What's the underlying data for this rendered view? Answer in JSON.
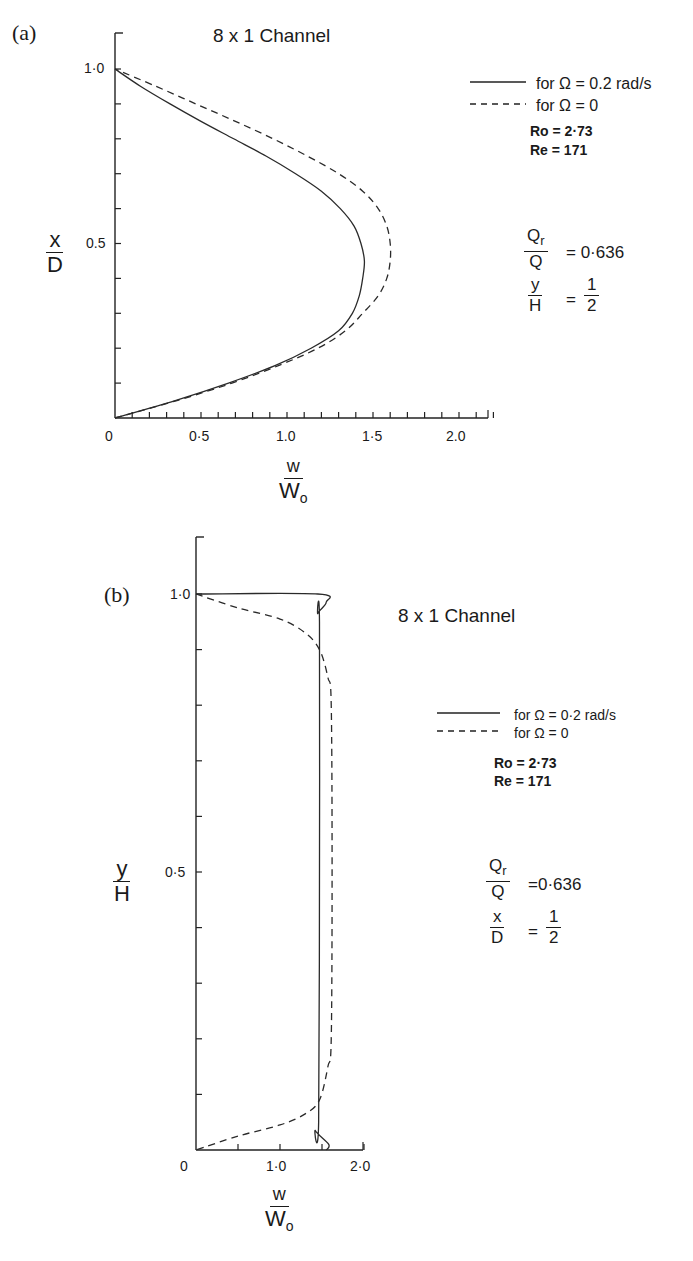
{
  "figure": {
    "panels": [
      {
        "tag": "(a)",
        "title": "8 x 1 Channel",
        "y_label": {
          "num": "x",
          "den": "D"
        },
        "x_label": {
          "num": "w",
          "den": "W",
          "den_sub": "o"
        },
        "y_ticks": [
          "1·0",
          "0.5"
        ],
        "x_ticks": [
          "0",
          "0·5",
          "1.0",
          "1·5",
          "2.0"
        ],
        "legend": [
          {
            "style": "solid",
            "text": "for  Ω = 0.2 rad/s"
          },
          {
            "style": "dashed",
            "text": "for  Ω = 0"
          }
        ],
        "params": [
          "Ro = 2·73",
          "Re = 171"
        ],
        "ratio": {
          "num": "Q",
          "num_sub": "r",
          "den": "Q",
          "value": "= 0·636"
        },
        "location": {
          "num": "y",
          "den": "H",
          "eq": "=",
          "fnum": "1",
          "fden": "2"
        }
      },
      {
        "tag": "(b)",
        "title": "8 x 1 Channel",
        "y_label": {
          "num": "y",
          "den": "H"
        },
        "x_label": {
          "num": "w",
          "den": "W",
          "den_sub": "o"
        },
        "y_ticks": [
          "1·0",
          "0·5"
        ],
        "x_ticks": [
          "0",
          "1·0",
          "2·0"
        ],
        "legend": [
          {
            "style": "solid",
            "text": "for Ω = 0·2 rad/s"
          },
          {
            "style": "dashed",
            "text": "for Ω = 0"
          }
        ],
        "params": [
          "Ro = 2·73",
          "Re = 171"
        ],
        "ratio": {
          "num": "Q",
          "num_sub": "r",
          "den": "Q",
          "value": "=0·636"
        },
        "location": {
          "num": "x",
          "den": "D",
          "eq": "=",
          "fnum": "1",
          "fden": "2"
        }
      }
    ]
  },
  "chart_data": [
    {
      "type": "line",
      "title": "(a) 8 x 1 Channel — spanwise velocity profile at y/H = 1/2",
      "xlabel": "w/Wo",
      "ylabel": "x/D",
      "xlim": [
        0,
        2.2
      ],
      "ylim": [
        0,
        1.1
      ],
      "x_ticks": [
        0,
        0.5,
        1.0,
        1.5,
        2.0
      ],
      "y_ticks": [
        0.5,
        1.0
      ],
      "grid": false,
      "legend_position": "upper right",
      "annotations": [
        "Ro = 2.73",
        "Re = 171",
        "Qr/Q = 0.636",
        "y/H = 1/2"
      ],
      "series": [
        {
          "name": "for Ω = 0.2 rad/s",
          "style": "solid",
          "points": [
            [
              0,
              0
            ],
            [
              0.35,
              0.05
            ],
            [
              0.66,
              0.1
            ],
            [
              0.93,
              0.15
            ],
            [
              1.14,
              0.2
            ],
            [
              1.3,
              0.25
            ],
            [
              1.38,
              0.3
            ],
            [
              1.42,
              0.35
            ],
            [
              1.44,
              0.4
            ],
            [
              1.45,
              0.45
            ],
            [
              1.43,
              0.5
            ],
            [
              1.39,
              0.55
            ],
            [
              1.31,
              0.6
            ],
            [
              1.2,
              0.65
            ],
            [
              1.05,
              0.7
            ],
            [
              0.88,
              0.75
            ],
            [
              0.69,
              0.8
            ],
            [
              0.5,
              0.85
            ],
            [
              0.32,
              0.9
            ],
            [
              0.15,
              0.95
            ],
            [
              0,
              1.0
            ]
          ]
        },
        {
          "name": "for Ω = 0",
          "style": "dashed",
          "points": [
            [
              0,
              0
            ],
            [
              0.36,
              0.05
            ],
            [
              0.68,
              0.1
            ],
            [
              0.95,
              0.15
            ],
            [
              1.18,
              0.2
            ],
            [
              1.34,
              0.25
            ],
            [
              1.44,
              0.3
            ],
            [
              1.53,
              0.35
            ],
            [
              1.58,
              0.4
            ],
            [
              1.6,
              0.45
            ],
            [
              1.6,
              0.5
            ],
            [
              1.58,
              0.55
            ],
            [
              1.53,
              0.6
            ],
            [
              1.44,
              0.65
            ],
            [
              1.3,
              0.7
            ],
            [
              1.12,
              0.75
            ],
            [
              0.92,
              0.8
            ],
            [
              0.7,
              0.85
            ],
            [
              0.47,
              0.9
            ],
            [
              0.24,
              0.95
            ],
            [
              0,
              1.0
            ]
          ]
        }
      ]
    },
    {
      "type": "line",
      "title": "(b) 8 x 1 Channel — velocity profile at x/D = 1/2",
      "xlabel": "w/Wo",
      "ylabel": "y/H",
      "xlim": [
        0,
        2.0
      ],
      "ylim": [
        0,
        1.1
      ],
      "x_ticks": [
        0,
        1.0,
        2.0
      ],
      "y_ticks": [
        0.5,
        1.0
      ],
      "grid": false,
      "legend_position": "upper right",
      "annotations": [
        "Ro = 2.73",
        "Re = 171",
        "Qr/Q = 0.636",
        "x/D = 1/2"
      ],
      "series": [
        {
          "name": "for Ω = 0.2 rad/s",
          "style": "solid",
          "points": [
            [
              0,
              1.0
            ],
            [
              1.45,
              1.0
            ],
            [
              1.55,
              0.985
            ],
            [
              1.45,
              0.965
            ],
            [
              1.47,
              0.95
            ],
            [
              1.47,
              0.5
            ],
            [
              1.46,
              0.05
            ],
            [
              1.42,
              0.035
            ],
            [
              1.58,
              0.01
            ],
            [
              1.55,
              0
            ]
          ]
        },
        {
          "name": "for Ω = 0",
          "style": "dashed",
          "points": [
            [
              0,
              1.0
            ],
            [
              0.5,
              0.975
            ],
            [
              1.0,
              0.955
            ],
            [
              1.3,
              0.93
            ],
            [
              1.47,
              0.9
            ],
            [
              1.57,
              0.85
            ],
            [
              1.61,
              0.8
            ],
            [
              1.62,
              0.5
            ],
            [
              1.61,
              0.2
            ],
            [
              1.57,
              0.15
            ],
            [
              1.47,
              0.09
            ],
            [
              1.3,
              0.065
            ],
            [
              1.0,
              0.045
            ],
            [
              0.5,
              0.025
            ],
            [
              0,
              0
            ]
          ]
        }
      ]
    }
  ]
}
